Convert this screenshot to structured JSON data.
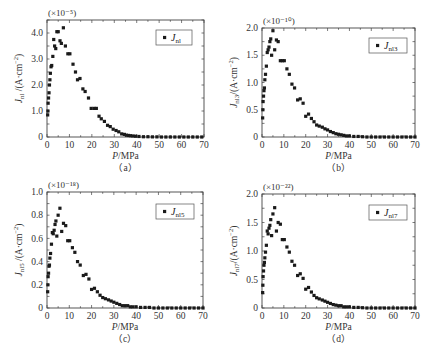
{
  "figure": {
    "panels_order": [
      "a",
      "b",
      "c",
      "d"
    ]
  },
  "chart_data": [
    {
      "id": "a",
      "type": "scatter",
      "panel_label": "（a）",
      "scale_label": "(×10⁻⁵)",
      "xlabel": "P/MPa",
      "ylabel": "J_nl /(A·cm⁻²)",
      "ylabel_main": "J",
      "ylabel_sub": "nl",
      "ylabel_rest": " /(A·cm",
      "legend": "J_nl",
      "legend_main": "J",
      "legend_sub": "nl",
      "xlim": [
        0,
        70
      ],
      "ylim": [
        0,
        4.5
      ],
      "xticks": [
        0,
        10,
        20,
        30,
        40,
        50,
        60,
        70
      ],
      "yticks": [
        0,
        1.0,
        2.0,
        3.0,
        4.0
      ],
      "ytick_labels": [
        "0",
        "1.0",
        "2.0",
        "3.0",
        "4.0"
      ],
      "box": {
        "x0": 47,
        "x1": 204,
        "y0": 20,
        "y1": 137
      },
      "legend_box": {
        "x": 156,
        "y": 30,
        "w": 36,
        "h": 15
      },
      "series": [
        {
          "name": "J_nl",
          "x": [
            0.3,
            0.4,
            0.5,
            0.7,
            0.9,
            1.1,
            1.3,
            1.5,
            1.8,
            2.1,
            2.6,
            3.0,
            3.4,
            3.9,
            4.4,
            5.0,
            5.8,
            6.4,
            7.3,
            8.2,
            9.3,
            10.2,
            11.6,
            12.7,
            13.6,
            14.7,
            16.0,
            17.0,
            18.5,
            19.7,
            21.0,
            22.0,
            23.2,
            24.2,
            25.6,
            27.0,
            28.2,
            29.5,
            30.8,
            32.0,
            33.3,
            34.5,
            35.4,
            36.3,
            37.2,
            38.3,
            39.5,
            41,
            43,
            45,
            47,
            49,
            51,
            53,
            55,
            57,
            59,
            61,
            63,
            65,
            67,
            69
          ],
          "y": [
            0.85,
            1.0,
            1.3,
            1.5,
            1.7,
            2.0,
            2.2,
            2.45,
            2.7,
            2.75,
            3.1,
            3.75,
            3.5,
            3.4,
            4.05,
            4.05,
            3.7,
            3.6,
            4.2,
            3.5,
            3.2,
            3.2,
            2.8,
            2.5,
            2.2,
            2.25,
            1.85,
            1.75,
            1.5,
            1.1,
            1.1,
            1.1,
            0.8,
            0.7,
            0.6,
            0.45,
            0.4,
            0.3,
            0.25,
            0.2,
            0.12,
            0.1,
            0.07,
            0.06,
            0.05,
            0.04,
            0.03,
            0.02,
            0.01,
            0.01,
            0.005,
            0.005,
            0,
            0,
            0,
            0,
            0,
            0,
            0,
            0,
            0,
            0
          ]
        }
      ]
    },
    {
      "id": "b",
      "type": "scatter",
      "panel_label": "（b）",
      "scale_label": "(×10⁻¹⁰)",
      "xlabel": "P/MPa",
      "ylabel": "J_nl3/(A·cm⁻²)",
      "ylabel_main": "J",
      "ylabel_sub": "nl3",
      "ylabel_rest": "/(A·cm",
      "legend": "J_nl3",
      "legend_main": "J",
      "legend_sub": "nl3",
      "xlim": [
        0,
        70
      ],
      "ylim": [
        0,
        2.0
      ],
      "xticks": [
        0,
        10,
        20,
        30,
        40,
        50,
        60,
        70
      ],
      "yticks": [
        0,
        0.5,
        1.0,
        1.5,
        2.0
      ],
      "ytick_labels": [
        "0",
        "0.5",
        "1.0",
        "1.5",
        "2.0"
      ],
      "box": {
        "x0": 262,
        "x1": 415,
        "y0": 28,
        "y1": 137
      },
      "legend_box": {
        "x": 369,
        "y": 38,
        "w": 38,
        "h": 15
      },
      "series": [
        {
          "name": "J_nl3",
          "x": [
            0.3,
            0.4,
            0.5,
            0.7,
            0.9,
            1.1,
            1.3,
            1.6,
            2.0,
            2.4,
            2.8,
            3.2,
            3.6,
            4.0,
            4.4,
            5.0,
            5.8,
            6.6,
            7.4,
            8.4,
            9.3,
            10.2,
            11.4,
            12.5,
            13.7,
            14.9,
            16.3,
            17.5,
            18.8,
            20.0,
            21.3,
            22.6,
            23.8,
            25.0,
            26.2,
            27.6,
            28.8,
            30.0,
            31.3,
            32.6,
            33.8,
            35.0,
            36.2,
            37.4,
            38.6,
            40,
            42,
            44,
            46,
            48,
            50,
            52,
            54,
            56,
            58,
            60,
            62,
            64,
            66,
            68,
            70
          ],
          "y": [
            0.35,
            0.5,
            0.65,
            0.75,
            0.85,
            0.9,
            1.05,
            1.15,
            1.3,
            1.55,
            1.6,
            1.65,
            1.75,
            1.8,
            1.5,
            1.95,
            1.6,
            1.78,
            1.75,
            1.4,
            1.4,
            1.4,
            1.25,
            1.15,
            0.97,
            0.9,
            0.68,
            0.7,
            0.62,
            0.38,
            0.42,
            0.34,
            0.28,
            0.22,
            0.2,
            0.18,
            0.15,
            0.13,
            0.1,
            0.08,
            0.06,
            0.05,
            0.04,
            0.03,
            0.02,
            0.02,
            0.01,
            0.01,
            0.005,
            0,
            0,
            0,
            0,
            0,
            0,
            0,
            0,
            0,
            0,
            0,
            0
          ]
        }
      ]
    },
    {
      "id": "c",
      "type": "scatter",
      "panel_label": "（c）",
      "scale_label": "(×10⁻¹⁸)",
      "xlabel": "P/MPa",
      "ylabel": "J_nl5 /(A·cm⁻²)",
      "ylabel_main": "J",
      "ylabel_sub": "nl5",
      "ylabel_rest": " /(A·cm",
      "legend": "J_nl5",
      "legend_main": "J",
      "legend_sub": "nl5",
      "xlim": [
        0,
        70
      ],
      "ylim": [
        0,
        1.0
      ],
      "xticks": [
        0,
        10,
        20,
        30,
        40,
        50,
        60,
        70
      ],
      "yticks": [
        0,
        0.2,
        0.4,
        0.6,
        0.8,
        1.0
      ],
      "ytick_labels": [
        "0",
        "0.2",
        "0.4",
        "0.6",
        "0.8",
        "1.0"
      ],
      "box": {
        "x0": 47,
        "x1": 203,
        "y0": 192,
        "y1": 308
      },
      "legend_box": {
        "x": 156,
        "y": 204,
        "w": 38,
        "h": 15
      },
      "series": [
        {
          "name": "J_nl5",
          "x": [
            0.3,
            0.4,
            0.5,
            0.7,
            0.9,
            1.1,
            1.3,
            1.6,
            2.0,
            2.4,
            2.8,
            3.2,
            3.6,
            4.0,
            4.4,
            5.0,
            5.8,
            6.6,
            7.4,
            8.4,
            9.3,
            10.2,
            11.4,
            12.5,
            13.7,
            14.9,
            16.3,
            17.5,
            18.8,
            20.0,
            21.3,
            22.6,
            23.8,
            25.0,
            26.2,
            27.6,
            28.8,
            30.0,
            31.3,
            32.6,
            33.8,
            35.0,
            36.2,
            37.4,
            38.6,
            40,
            42,
            44,
            46,
            48,
            50,
            52,
            54,
            56,
            58,
            60,
            62,
            64,
            66,
            68,
            70
          ],
          "y": [
            0.14,
            0.2,
            0.27,
            0.3,
            0.36,
            0.37,
            0.43,
            0.47,
            0.55,
            0.65,
            0.64,
            0.67,
            0.72,
            0.75,
            0.62,
            0.8,
            0.86,
            0.66,
            0.73,
            0.71,
            0.58,
            0.58,
            0.52,
            0.48,
            0.4,
            0.37,
            0.28,
            0.29,
            0.25,
            0.16,
            0.17,
            0.14,
            0.11,
            0.09,
            0.08,
            0.07,
            0.06,
            0.05,
            0.04,
            0.03,
            0.02,
            0.02,
            0.02,
            0.01,
            0.01,
            0.01,
            0.005,
            0.005,
            0.005,
            0,
            0,
            0,
            0,
            0,
            0,
            0,
            0,
            0,
            0,
            0,
            0
          ]
        }
      ]
    },
    {
      "id": "d",
      "type": "scatter",
      "panel_label": "（d）",
      "scale_label": "(×10⁻²²)",
      "xlabel": "P/MPa",
      "ylabel": "J_nl7/(A·cm⁻²)",
      "ylabel_main": "J",
      "ylabel_sub": "nl7",
      "ylabel_rest": "/(A·cm",
      "legend": "J_nl7",
      "legend_main": "J",
      "legend_sub": "nl7",
      "xlim": [
        0,
        70
      ],
      "ylim": [
        0,
        2.0
      ],
      "xticks": [
        0,
        10,
        20,
        30,
        40,
        50,
        60,
        70
      ],
      "yticks": [
        0,
        0.5,
        1.0,
        1.5,
        2.0
      ],
      "ytick_labels": [
        "0",
        "0.5",
        "1.0",
        "1.5",
        "2.0"
      ],
      "box": {
        "x0": 262,
        "x1": 415,
        "y0": 194,
        "y1": 308
      },
      "legend_box": {
        "x": 369,
        "y": 205,
        "w": 38,
        "h": 15
      },
      "series": [
        {
          "name": "J_nl7",
          "x": [
            0.3,
            0.4,
            0.5,
            0.7,
            0.9,
            1.1,
            1.3,
            1.6,
            2.0,
            2.4,
            2.8,
            3.2,
            3.6,
            4.0,
            4.4,
            5.0,
            5.8,
            6.6,
            7.4,
            8.4,
            9.3,
            10.2,
            11.4,
            12.5,
            13.7,
            14.9,
            16.3,
            17.5,
            18.8,
            20.0,
            21.3,
            22.6,
            23.8,
            25.0,
            26.2,
            27.6,
            28.8,
            30.0,
            31.3,
            32.6,
            33.8,
            35.0,
            36.2,
            37.4,
            38.6,
            40,
            42,
            44,
            46,
            48,
            50,
            52,
            54,
            56,
            58,
            60,
            62,
            64,
            66,
            68,
            70
          ],
          "y": [
            0.27,
            0.4,
            0.55,
            0.65,
            0.75,
            0.8,
            0.88,
            0.98,
            1.1,
            1.35,
            1.3,
            1.4,
            1.45,
            1.55,
            1.27,
            1.65,
            1.76,
            1.35,
            1.5,
            1.47,
            1.2,
            1.2,
            1.07,
            0.98,
            0.82,
            0.75,
            0.57,
            0.6,
            0.52,
            0.33,
            0.36,
            0.28,
            0.22,
            0.18,
            0.16,
            0.14,
            0.12,
            0.1,
            0.08,
            0.06,
            0.05,
            0.04,
            0.04,
            0.02,
            0.02,
            0.02,
            0.01,
            0.01,
            0.005,
            0,
            0,
            0,
            0,
            0,
            0,
            0,
            0,
            0,
            0,
            0,
            0
          ]
        }
      ]
    }
  ]
}
